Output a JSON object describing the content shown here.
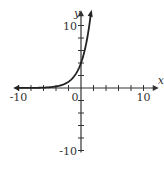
{
  "chart_data": {
    "type": "line",
    "title": "",
    "xlabel": "x",
    "ylabel": "y",
    "xlim": [
      -10,
      10
    ],
    "ylim": [
      -10,
      10
    ],
    "x_tick_step": 2,
    "y_tick_step": 2,
    "tick_labels": {
      "x_min": "-10",
      "x_max": "10",
      "y_min": "-10",
      "y_max": "10",
      "origin": "0"
    },
    "grid": false,
    "series": [
      {
        "name": "exponential curve",
        "function": "y = 4 * 2^x",
        "x": [
          -10,
          -6,
          -4,
          -3,
          -2,
          -1,
          0,
          1,
          1.5
        ],
        "values": [
          0.004,
          0.06,
          0.25,
          0.5,
          1,
          2,
          4,
          8,
          11.3
        ]
      }
    ],
    "annotations": [
      "curve has arrowheads at both ends",
      "y-intercept at 4"
    ]
  },
  "colors": {
    "axis": "#333333",
    "curve": "#222222"
  }
}
